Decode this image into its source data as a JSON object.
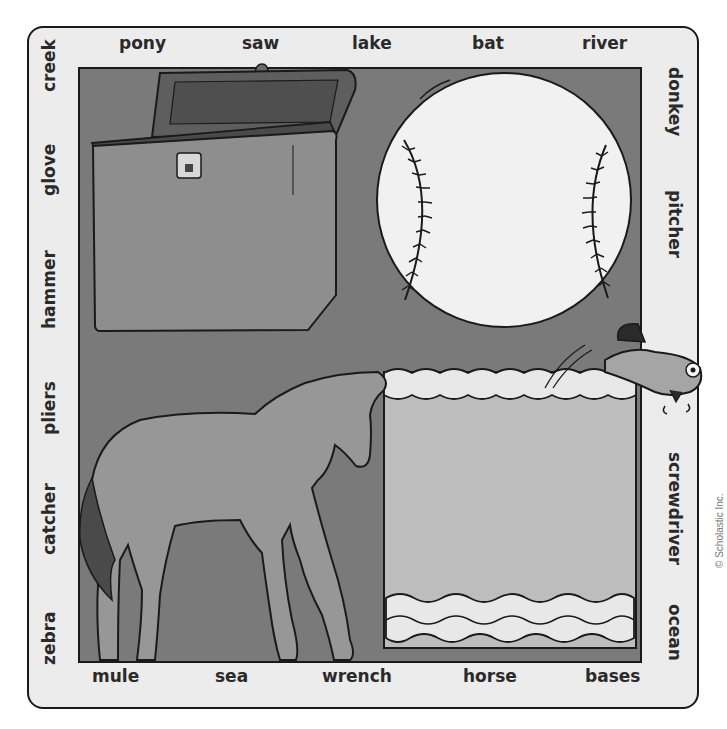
{
  "puzzle": {
    "words_top": [
      "pony",
      "saw",
      "lake",
      "bat",
      "river"
    ],
    "words_bottom": [
      "mule",
      "sea",
      "wrench",
      "horse",
      "bases"
    ],
    "words_left": [
      "creek",
      "glove",
      "hammer",
      "pliers",
      "catcher",
      "zebra"
    ],
    "words_right": [
      "donkey",
      "pitcher",
      "screwdriver",
      "ocean"
    ],
    "pictures": [
      "toolbox",
      "baseball",
      "horse",
      "water",
      "fish"
    ]
  },
  "copyright": "© Scholastic Inc.",
  "colors": {
    "card": "#ececec",
    "panel": "#7a7a7a",
    "toolbox": "#8e8e8e",
    "toolbox_lid": "#5e5e5e",
    "baseball": "#f1f1f1",
    "horse": "#979797",
    "tail": "#4a4a4a",
    "water": "#bdbdbd",
    "foam": "#e8e8e8",
    "outline": "#1a1a1a"
  }
}
